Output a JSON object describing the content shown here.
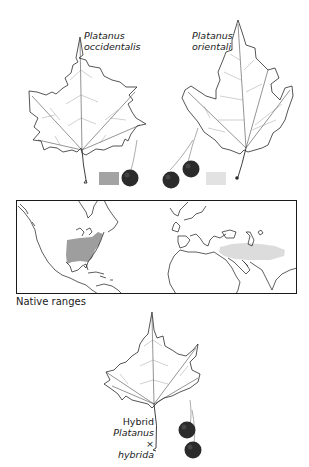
{
  "species": [
    {
      "id": "occidentalis",
      "genus": "Platanus",
      "epithet": "occidentalis",
      "range_color": "#9e9e9e",
      "range_region": "Eastern North America"
    },
    {
      "id": "orientalis",
      "genus": "Platanus",
      "epithet": "orientalis",
      "range_color": "#dcdcdc",
      "range_region": "Southeastern Europe to Western Asia"
    }
  ],
  "hybrid": {
    "line1": "Hybrid",
    "genus": "Platanus",
    "epithet": "× hybrida"
  },
  "map": {
    "caption": "Native ranges"
  },
  "colors": {
    "occidentalis_swatch": "#a3a3a3",
    "orientalis_swatch": "#e2e2e2",
    "fruit": "#2b2b2b",
    "outline": "#1a1a1a"
  }
}
